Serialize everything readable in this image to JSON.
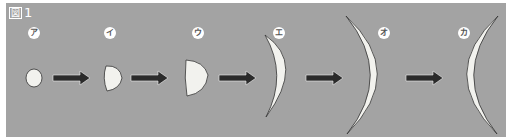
{
  "figure": {
    "title_box": "図",
    "title_number": "1"
  },
  "stages": [
    {
      "label": "ア",
      "shape": "small-round-cell"
    },
    {
      "label": "イ",
      "shape": "half-dome-cell"
    },
    {
      "label": "ウ",
      "shape": "larger-half-dome-cell"
    },
    {
      "label": "エ",
      "shape": "crescent-convex-right"
    },
    {
      "label": "オ",
      "shape": "large-crescent-convex-right"
    },
    {
      "label": "カ",
      "shape": "large-crescent-convex-left"
    }
  ],
  "colors": {
    "background": "#a3a3a3",
    "shape_fill": "#f2f2ee",
    "outline": "#333333",
    "arrow": "#2b2b2b"
  }
}
